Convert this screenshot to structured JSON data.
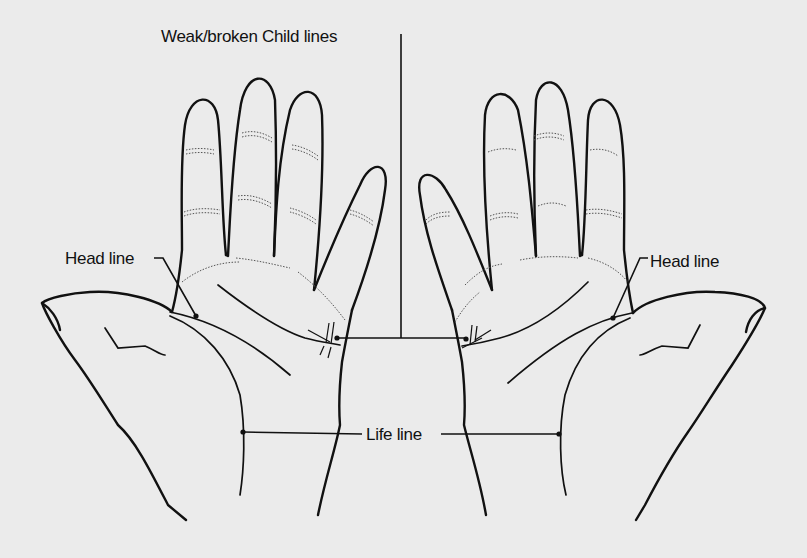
{
  "diagram": {
    "labels": {
      "child_lines": "Weak/broken Child lines",
      "head_line_left": "Head line",
      "head_line_right": "Head line",
      "life_line": "Life line"
    },
    "hands": [
      {
        "side": "left",
        "features": [
          "head-line",
          "life-line",
          "heart-line",
          "child-lines"
        ]
      },
      {
        "side": "right",
        "features": [
          "head-line",
          "life-line",
          "heart-line",
          "child-lines"
        ]
      }
    ],
    "colors": {
      "background": "#ebebeb",
      "ink": "#111111"
    }
  }
}
